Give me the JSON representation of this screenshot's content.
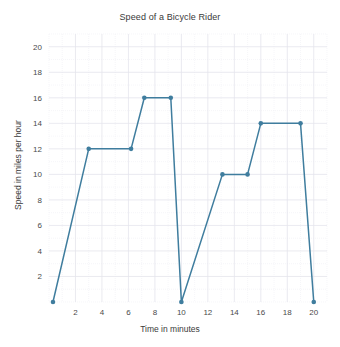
{
  "chart_data": {
    "type": "line",
    "title": "Speed of a Bicycle Rider",
    "xlabel": "Time in minutes",
    "ylabel": "Speed in miles per hour",
    "xlim": [
      0,
      21
    ],
    "ylim": [
      0,
      21
    ],
    "xticks": [
      2,
      4,
      6,
      8,
      10,
      12,
      14,
      16,
      18,
      20
    ],
    "yticks": [
      2,
      4,
      6,
      8,
      10,
      12,
      14,
      16,
      18,
      20
    ],
    "xtick_labels": [
      "2",
      "4",
      "6",
      "8",
      "10",
      "12",
      "14",
      "16",
      "18",
      "20"
    ],
    "ytick_labels": [
      "2",
      "4",
      "6",
      "8",
      "10",
      "12",
      "14",
      "16",
      "18",
      "20"
    ],
    "grid": true,
    "legend": false,
    "series": [
      {
        "name": "Speed",
        "color": "#3f7d9e",
        "marker": "circle",
        "x": [
          0.3,
          3.0,
          6.2,
          7.2,
          9.2,
          10.0,
          13.1,
          15.0,
          16.0,
          19.0,
          20.0
        ],
        "y": [
          0.0,
          12.0,
          12.0,
          16.0,
          16.0,
          0.0,
          10.0,
          10.0,
          14.0,
          14.0,
          0.0
        ],
        "points": [
          {
            "x": 0.3,
            "y": 0
          },
          {
            "x": 3.0,
            "y": 12
          },
          {
            "x": 6.2,
            "y": 12
          },
          {
            "x": 7.2,
            "y": 16
          },
          {
            "x": 9.2,
            "y": 16
          },
          {
            "x": 10.0,
            "y": 0
          },
          {
            "x": 13.1,
            "y": 10
          },
          {
            "x": 15.0,
            "y": 10
          },
          {
            "x": 16.0,
            "y": 14
          },
          {
            "x": 19.0,
            "y": 14
          },
          {
            "x": 20.0,
            "y": 0
          }
        ]
      }
    ]
  },
  "style": {
    "line_color": "#3f7d9e",
    "marker_color": "#3f7d9e",
    "grid_major_color": "#e4e4ec",
    "grid_minor_color": "#f0f0f5",
    "background": "#ffffff",
    "text_color": "#3c3c3c"
  }
}
